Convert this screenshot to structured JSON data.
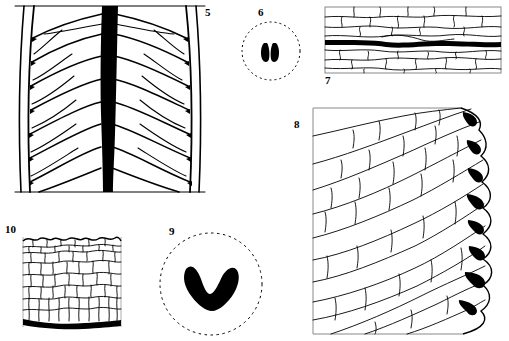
{
  "plate": {
    "title": "Botanical micrograph plate — leaf venation, stomata and epidermal cells",
    "width": 509,
    "height": 341,
    "background_color": "#ffffff",
    "ink_color": "#000000"
  },
  "figures": [
    {
      "number": "5",
      "label": "5",
      "caption": "Leaf lamina with thick black midrib and arching secondary veins",
      "type": "leaf-venation",
      "label_position": "top-right",
      "has_border": true,
      "midrib_color": "#000000"
    },
    {
      "number": "6",
      "label": "6",
      "caption": "Dashed circular outline enclosing two dark bean-shaped guard cells",
      "type": "stoma-detail",
      "label_position": "top",
      "has_border": false,
      "outline_style": "dashed-circle",
      "marks": 2,
      "mark_color": "#000000"
    },
    {
      "number": "7",
      "label": "7",
      "caption": "Elongated epidermal cells crossed by one thick black vein",
      "type": "epidermis-vein",
      "label_position": "bottom-left",
      "has_border": true,
      "vein_color": "#000000"
    },
    {
      "number": "8",
      "label": "8",
      "caption": "Leaf margin with oblique elongate cells and eight dark marginal glands",
      "type": "leaf-margin-glands",
      "label_position": "left",
      "has_border": true,
      "gland_count": 8,
      "gland_color": "#000000"
    },
    {
      "number": "9",
      "label": "9",
      "caption": "Dashed circular outline enclosing a thick black V-shaped mark",
      "type": "stoma-detail",
      "label_position": "top-left",
      "has_border": false,
      "outline_style": "dashed-circle",
      "marks": 1,
      "mark_color": "#000000"
    },
    {
      "number": "10",
      "label": "10",
      "caption": "Dense polygonal cell tissue with wavy upper edge and thick black basal band",
      "type": "cell-tissue",
      "label_position": "top-left",
      "has_border": true,
      "band_color": "#000000"
    }
  ]
}
